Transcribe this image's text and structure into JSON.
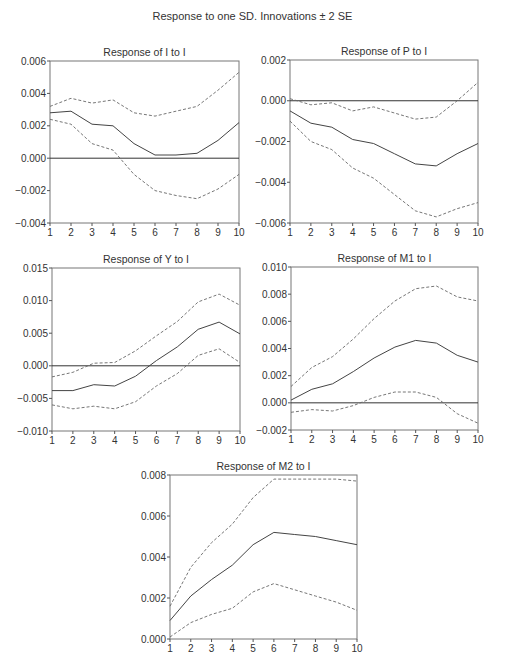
{
  "figure": {
    "title": "Response to one SD. Innovations ± 2 SE"
  },
  "chart_data": [
    {
      "type": "line",
      "title": "Response of I to I",
      "frame": {
        "x0": 50,
        "y0": 61,
        "x1": 239,
        "y1": 223
      },
      "x": [
        1,
        2,
        3,
        4,
        5,
        6,
        7,
        8,
        9,
        10
      ],
      "xticks": [
        "1",
        "2",
        "3",
        "4",
        "5",
        "6",
        "7",
        "8",
        "9",
        "10"
      ],
      "ylim": [
        -0.004,
        0.006
      ],
      "yticks": [
        -0.004,
        -0.002,
        0.0,
        0.002,
        0.004,
        0.006
      ],
      "ytick_labels": [
        "−0.004",
        "−0.002",
        "0.000",
        "0.002",
        "0.004",
        "0.006"
      ],
      "series": [
        {
          "name": "response",
          "style": "solid",
          "values": [
            0.0028,
            0.0029,
            0.0021,
            0.002,
            0.0009,
            0.0002,
            0.0002,
            0.0003,
            0.0011,
            0.0022
          ]
        },
        {
          "name": "+2 SE",
          "style": "dashed",
          "values": [
            0.0032,
            0.0037,
            0.0034,
            0.0036,
            0.0028,
            0.0026,
            0.0029,
            0.0032,
            0.0042,
            0.0053
          ]
        },
        {
          "name": "-2 SE",
          "style": "dashed",
          "values": [
            0.0024,
            0.0021,
            0.0009,
            0.0005,
            -0.001,
            -0.002,
            -0.0023,
            -0.0025,
            -0.0019,
            -0.001
          ]
        }
      ],
      "grid": false,
      "zero_line": true
    },
    {
      "type": "line",
      "title": "Response of P to I",
      "frame": {
        "x0": 290,
        "y0": 60,
        "x1": 478,
        "y1": 223
      },
      "x": [
        1,
        2,
        3,
        4,
        5,
        6,
        7,
        8,
        9,
        10
      ],
      "xticks": [
        "1",
        "2",
        "3",
        "4",
        "5",
        "6",
        "7",
        "8",
        "9",
        "10"
      ],
      "ylim": [
        -0.006,
        0.002
      ],
      "yticks": [
        -0.006,
        -0.004,
        -0.002,
        0.0,
        0.002
      ],
      "ytick_labels": [
        "−0.006",
        "−0.004",
        "−0.002",
        "0.000",
        "0.002"
      ],
      "series": [
        {
          "name": "response",
          "style": "solid",
          "values": [
            -0.0005,
            -0.0011,
            -0.0013,
            -0.0019,
            -0.0021,
            -0.0026,
            -0.0031,
            -0.0032,
            -0.0026,
            -0.0021
          ]
        },
        {
          "name": "+2 SE",
          "style": "dashed",
          "values": [
            0.0001,
            -0.0002,
            -0.0001,
            -0.0005,
            -0.0003,
            -0.0006,
            -0.0009,
            -0.0008,
            0.0,
            0.0009
          ]
        },
        {
          "name": "-2 SE",
          "style": "dashed",
          "values": [
            -0.001,
            -0.002,
            -0.0024,
            -0.0033,
            -0.0038,
            -0.0046,
            -0.0054,
            -0.0057,
            -0.0053,
            -0.005
          ]
        }
      ],
      "grid": false,
      "zero_line": true
    },
    {
      "type": "line",
      "title": "Response of Y to I",
      "frame": {
        "x0": 52,
        "y0": 268,
        "x1": 240,
        "y1": 431
      },
      "x": [
        1,
        2,
        3,
        4,
        5,
        6,
        7,
        8,
        9,
        10
      ],
      "xticks": [
        "1",
        "2",
        "3",
        "4",
        "5",
        "6",
        "7",
        "8",
        "9",
        "10"
      ],
      "ylim": [
        -0.01,
        0.015
      ],
      "yticks": [
        -0.01,
        -0.005,
        0.0,
        0.005,
        0.01,
        0.015
      ],
      "ytick_labels": [
        "−0.010",
        "−0.005",
        "0.000",
        "0.005",
        "0.010",
        "0.015"
      ],
      "series": [
        {
          "name": "response",
          "style": "solid",
          "values": [
            -0.0038,
            -0.0038,
            -0.0029,
            -0.0031,
            -0.0016,
            0.0008,
            0.0029,
            0.0056,
            0.0067,
            0.0049
          ]
        },
        {
          "name": "+2 SE",
          "style": "dashed",
          "values": [
            -0.0017,
            -0.001,
            0.0004,
            0.0005,
            0.0023,
            0.0046,
            0.0068,
            0.0098,
            0.011,
            0.0093
          ]
        },
        {
          "name": "-2 SE",
          "style": "dashed",
          "values": [
            -0.006,
            -0.0066,
            -0.0062,
            -0.0066,
            -0.0055,
            -0.0031,
            -0.0012,
            0.0016,
            0.0026,
            0.0005
          ]
        }
      ],
      "grid": false,
      "zero_line": true
    },
    {
      "type": "line",
      "title": "Response of M1 to I",
      "frame": {
        "x0": 291,
        "y0": 267,
        "x1": 478,
        "y1": 430
      },
      "x": [
        1,
        2,
        3,
        4,
        5,
        6,
        7,
        8,
        9,
        10
      ],
      "xticks": [
        "1",
        "2",
        "3",
        "4",
        "5",
        "6",
        "7",
        "8",
        "9",
        "10"
      ],
      "ylim": [
        -0.002,
        0.01
      ],
      "yticks": [
        -0.002,
        0.0,
        0.002,
        0.004,
        0.006,
        0.008,
        0.01
      ],
      "ytick_labels": [
        "−0.002",
        "0.000",
        "0.002",
        "0.004",
        "0.006",
        "0.008",
        "0.010"
      ],
      "series": [
        {
          "name": "response",
          "style": "solid",
          "values": [
            0.0002,
            0.001,
            0.0014,
            0.0023,
            0.0033,
            0.0041,
            0.0046,
            0.0044,
            0.0035,
            0.003
          ]
        },
        {
          "name": "+2 SE",
          "style": "dashed",
          "values": [
            0.0012,
            0.0026,
            0.0034,
            0.0047,
            0.0062,
            0.0075,
            0.0084,
            0.0086,
            0.0078,
            0.0075
          ]
        },
        {
          "name": "-2 SE",
          "style": "dashed",
          "values": [
            -0.0007,
            -0.0005,
            -0.0006,
            -0.0002,
            0.0004,
            0.0008,
            0.0008,
            0.0004,
            -0.0008,
            -0.0015
          ]
        }
      ],
      "grid": false,
      "zero_line": true
    },
    {
      "type": "line",
      "title": "Response of M2 to I",
      "frame": {
        "x0": 170,
        "y0": 475,
        "x1": 357,
        "y1": 639
      },
      "x": [
        1,
        2,
        3,
        4,
        5,
        6,
        7,
        8,
        9,
        10
      ],
      "xticks": [
        "1",
        "2",
        "3",
        "4",
        "5",
        "6",
        "7",
        "8",
        "9",
        "10"
      ],
      "ylim": [
        0.0,
        0.008
      ],
      "yticks": [
        0.0,
        0.002,
        0.004,
        0.006,
        0.008
      ],
      "ytick_labels": [
        "0.000",
        "0.002",
        "0.004",
        "0.006",
        "0.008"
      ],
      "series": [
        {
          "name": "response",
          "style": "solid",
          "values": [
            0.0009,
            0.0021,
            0.0029,
            0.0036,
            0.0046,
            0.0052,
            0.0051,
            0.005,
            0.0048,
            0.0046
          ]
        },
        {
          "name": "+2 SE",
          "style": "dashed",
          "values": [
            0.0016,
            0.0035,
            0.0047,
            0.0056,
            0.0069,
            0.0078,
            0.0078,
            0.0078,
            0.0078,
            0.0077
          ]
        },
        {
          "name": "-2 SE",
          "style": "dashed",
          "values": [
            0.0001,
            0.0008,
            0.0012,
            0.0015,
            0.0023,
            0.0027,
            0.0024,
            0.0021,
            0.0018,
            0.0014
          ]
        }
      ],
      "grid": false,
      "zero_line": false
    }
  ]
}
